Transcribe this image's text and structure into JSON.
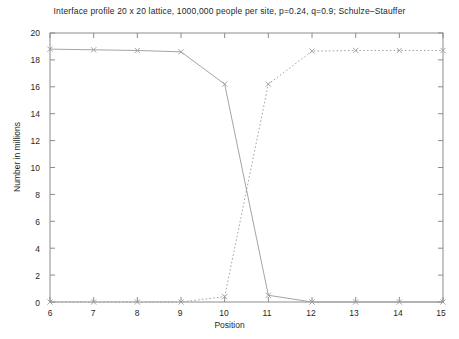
{
  "chart_data": {
    "type": "line",
    "title": "Interface profile 20 x 20 lattice, 1000,000 people per site, p=0.24, q=0.9; Schulze–Stauffer",
    "xlabel": "Position",
    "ylabel": "Number in millions",
    "xlim": [
      6,
      15
    ],
    "ylim": [
      0,
      20
    ],
    "xticks": [
      "6",
      "7",
      "8",
      "9",
      "10",
      "11",
      "12",
      "13",
      "14",
      "15"
    ],
    "yticks": [
      "0",
      "2",
      "4",
      "6",
      "8",
      "10",
      "12",
      "14",
      "16",
      "18",
      "20"
    ],
    "grid": false,
    "legend": "none",
    "x": [
      6,
      7,
      8,
      9,
      10,
      11,
      12,
      13,
      14,
      15
    ],
    "series": [
      {
        "name": "descending-profile",
        "style": "solid",
        "marker": "x",
        "color": "#9a9a9a",
        "values": [
          18.8,
          18.75,
          18.7,
          18.6,
          16.2,
          0.5,
          0.0,
          0.0,
          0.0,
          0.0
        ]
      },
      {
        "name": "ascending-profile",
        "style": "dotted",
        "marker": "x",
        "color": "#9a9a9a",
        "values": [
          0.0,
          0.0,
          0.0,
          0.0,
          0.4,
          16.2,
          18.65,
          18.7,
          18.7,
          18.7
        ]
      }
    ]
  },
  "axes": {
    "frame_color": "#8c8c8c"
  }
}
